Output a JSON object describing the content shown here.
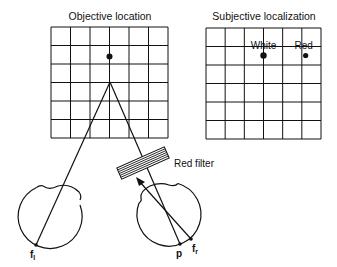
{
  "panels": {
    "objective": {
      "title": "Objective location",
      "grid": {
        "columns": 6,
        "rows": 6
      },
      "target_point": {
        "column_line": 3,
        "row_line": 3
      }
    },
    "subjective": {
      "title": "Subjective localization",
      "grid": {
        "columns": 6,
        "rows": 6
      },
      "points": [
        {
          "label": "White",
          "column_line": 3,
          "row_line": 3
        },
        {
          "label": "Red",
          "column_line": 5.2,
          "row_line": 3
        }
      ]
    }
  },
  "filter": {
    "label": "Red filter"
  },
  "eyes": {
    "left": {
      "fovea_label": "f",
      "fovea_subscript": "l"
    },
    "right": {
      "point_label": "p",
      "fovea_label": "f",
      "fovea_subscript": "r"
    }
  },
  "colors": {
    "ink": "#111111",
    "background": "#ffffff"
  }
}
